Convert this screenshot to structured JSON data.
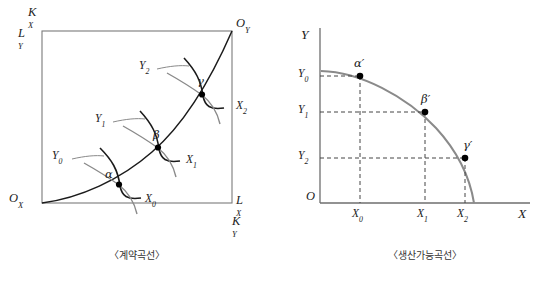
{
  "figure": {
    "panels": [
      {
        "id": "contract-curve",
        "caption": "〈계약곡선〉",
        "corner_labels": {
          "top_left_upper": "K",
          "top_left_upper_sub": "X",
          "top_left_lower": "L",
          "top_left_lower_sub": "Y",
          "top_right": "O",
          "top_right_sub": "Y",
          "bottom_left": "O",
          "bottom_left_sub": "X",
          "bottom_right_upper": "L",
          "bottom_right_upper_sub": "X",
          "bottom_right_lower": "K",
          "bottom_right_lower_sub": "Y"
        },
        "tangency_points": [
          {
            "name": "alpha",
            "symbol": "α"
          },
          {
            "name": "beta",
            "symbol": "β"
          },
          {
            "name": "gamma",
            "symbol": "γ"
          }
        ],
        "isoquants_y": [
          {
            "base": "Y",
            "sub": "0"
          },
          {
            "base": "Y",
            "sub": "1"
          },
          {
            "base": "Y",
            "sub": "2"
          }
        ],
        "isoquants_x": [
          {
            "base": "X",
            "sub": "0"
          },
          {
            "base": "X",
            "sub": "1"
          },
          {
            "base": "X",
            "sub": "2"
          }
        ]
      },
      {
        "id": "production-possibility-curve",
        "caption": "〈생산가능곡선〉",
        "axis_labels": {
          "y_axis": "Y",
          "x_axis": "X",
          "origin": "O"
        },
        "y_ticks": [
          {
            "base": "Y",
            "sub": "0"
          },
          {
            "base": "Y",
            "sub": "1"
          },
          {
            "base": "Y",
            "sub": "2"
          }
        ],
        "x_ticks": [
          {
            "base": "X",
            "sub": "0"
          },
          {
            "base": "X",
            "sub": "1"
          },
          {
            "base": "X",
            "sub": "2"
          }
        ],
        "points": [
          {
            "name": "alpha-prime",
            "symbol": "α′"
          },
          {
            "name": "beta-prime",
            "symbol": "β′"
          },
          {
            "name": "gamma-prime",
            "symbol": "γ′"
          }
        ]
      }
    ],
    "colors": {
      "curve_dark": "#1b1b1b",
      "curve_gray": "#8a8a8a",
      "axis": "#6e6e6e",
      "box": "#7a7a7a",
      "dashed": "#444444",
      "point_fill": "#000000"
    }
  }
}
